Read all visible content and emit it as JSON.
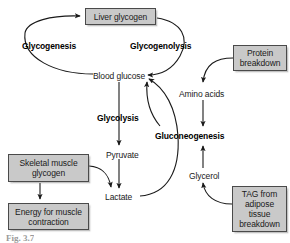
{
  "figure": {
    "type": "biochemical-pathway-diagram",
    "caption": "Fig. 3.7",
    "colors": {
      "box_fill": "#c9c9c9",
      "box_border": "#4a4a4a",
      "text": "#1a1a1a",
      "arrow": "#1a1a1a",
      "background": "#ffffff"
    }
  },
  "boxes": [
    {
      "id": "liver-glycogen",
      "label": "Liver glycogen",
      "x": 85,
      "y": 8,
      "w": 71,
      "h": 17
    },
    {
      "id": "protein-breakdown",
      "label": "Protein\nbreakdown",
      "x": 233,
      "y": 45,
      "w": 54,
      "h": 26
    },
    {
      "id": "skeletal-muscle-glycogen",
      "label": "Skeletal muscle\nglycogen",
      "x": 8,
      "y": 154,
      "w": 81,
      "h": 28
    },
    {
      "id": "energy-for-muscle-contraction",
      "label": "Energy for muscle\ncontraction",
      "x": 8,
      "y": 203,
      "w": 81,
      "h": 27
    },
    {
      "id": "tag-adipose-breakdown",
      "label": "TAG from\nadipose\ntissue\nbreakdown",
      "x": 232,
      "y": 186,
      "w": 55,
      "h": 46
    }
  ],
  "plain_nodes": [
    {
      "id": "blood-glucose",
      "label": "Blood glucose",
      "x": 93,
      "y": 71
    },
    {
      "id": "amino-acids",
      "label": "Amino acids",
      "x": 179,
      "y": 89
    },
    {
      "id": "pyruvate",
      "label": "Pyruvate",
      "x": 106,
      "y": 150
    },
    {
      "id": "glycerol",
      "label": "Glycerol",
      "x": 189,
      "y": 171
    },
    {
      "id": "lactate",
      "label": "Lactate",
      "x": 105,
      "y": 192
    }
  ],
  "process_labels": [
    {
      "id": "glycogenesis",
      "label": "Glycogenesis",
      "x": 22,
      "y": 41
    },
    {
      "id": "glycogenolysis",
      "label": "Glycogenolysis",
      "x": 130,
      "y": 41
    },
    {
      "id": "glycolysis",
      "label": "Glycolysis",
      "x": 97,
      "y": 113
    },
    {
      "id": "gluconeogenesis",
      "label": "Gluconeogenesis",
      "x": 155,
      "y": 131
    }
  ],
  "relationships": [
    {
      "from": "blood-glucose",
      "to": "liver-glycogen",
      "via": "glycogenesis",
      "style": "curve-left"
    },
    {
      "from": "liver-glycogen",
      "to": "blood-glucose",
      "via": "glycogenolysis",
      "style": "curve-right"
    },
    {
      "from": "blood-glucose",
      "to": "pyruvate",
      "via": "glycolysis",
      "style": "straight-down"
    },
    {
      "from": "pyruvate",
      "to": "lactate",
      "via": "",
      "style": "straight-down"
    },
    {
      "from": "skeletal-muscle-glycogen",
      "to": "lactate",
      "via": "",
      "style": "curve"
    },
    {
      "from": "skeletal-muscle-glycogen",
      "to": "energy-for-muscle-contraction",
      "via": "",
      "style": "straight-down"
    },
    {
      "from": "lactate",
      "to": "blood-glucose",
      "via": "gluconeogenesis",
      "style": "big-curve-left"
    },
    {
      "from": "protein-breakdown",
      "to": "amino-acids",
      "via": "",
      "style": "curve"
    },
    {
      "from": "amino-acids",
      "to": "gluconeogenesis",
      "via": "",
      "style": "straight-down"
    },
    {
      "from": "glycerol",
      "to": "gluconeogenesis",
      "via": "",
      "style": "straight-up"
    },
    {
      "from": "tag-adipose-breakdown",
      "to": "glycerol",
      "via": "",
      "style": "curve"
    },
    {
      "from": "gluconeogenesis",
      "to": "blood-glucose",
      "via": "",
      "style": "curve-up-left"
    }
  ]
}
